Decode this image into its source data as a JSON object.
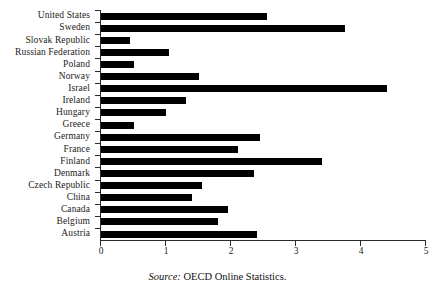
{
  "caption": {
    "source_label": "Source:",
    "source_text": " OECD Online Statistics."
  },
  "axis": {
    "ticks": [
      "0",
      "1",
      "2",
      "3",
      "4",
      "5"
    ]
  },
  "chart_data": {
    "type": "bar",
    "orientation": "horizontal",
    "title": "",
    "subtitle": "",
    "xlabel": "",
    "ylabel": "",
    "xlim": [
      0,
      5
    ],
    "xticks": [
      0,
      1,
      2,
      3,
      4,
      5
    ],
    "grid": false,
    "legend": false,
    "bar_color": "#000000",
    "source": "Source: OECD Online Statistics.",
    "categories": [
      "United States",
      "Sweden",
      "Slovak Republic",
      "Russian Federation",
      "Poland",
      "Norway",
      "Israel",
      "Ireland",
      "Hungary",
      "Greece",
      "Germany",
      "France",
      "Finland",
      "Denmark",
      "Czech Republic",
      "China",
      "Canada",
      "Belgium",
      "Austria"
    ],
    "values": [
      2.55,
      3.75,
      0.45,
      1.05,
      0.5,
      1.5,
      4.4,
      1.3,
      1.0,
      0.5,
      2.45,
      2.1,
      3.4,
      2.35,
      1.55,
      1.4,
      1.95,
      1.8,
      2.4
    ]
  }
}
